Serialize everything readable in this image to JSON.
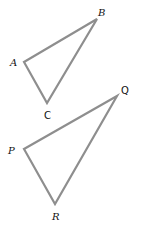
{
  "diagram": {
    "type": "similar-triangles",
    "stroke_color": "#8e8e8e",
    "label_color": "#111111",
    "triangles": [
      {
        "name": "ABC",
        "vertices": [
          "A",
          "B",
          "C"
        ]
      },
      {
        "name": "PQR",
        "vertices": [
          "P",
          "Q",
          "R"
        ]
      }
    ],
    "labels": {
      "A": "A",
      "B": "B",
      "C": "C",
      "P": "P",
      "Q": "Q",
      "R": "R"
    }
  }
}
